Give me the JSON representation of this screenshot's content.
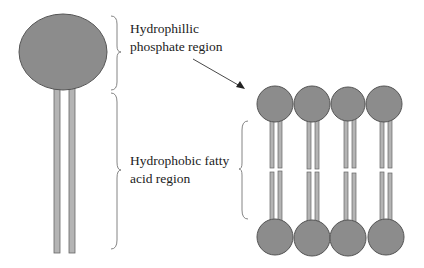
{
  "diagram": {
    "labels": {
      "head_region": {
        "line1": "Hydrophillic",
        "line2": "phosphate region"
      },
      "tail_region": {
        "line1": "Hydrophobic fatty",
        "line2": "acid region"
      }
    },
    "colors": {
      "head_fill": "#8c8c8c",
      "head_stroke": "#555555",
      "tail_fill": "#b4b4b4",
      "tail_stroke": "#666666",
      "brace_stroke": "#777777",
      "arrow": "#333333",
      "text": "#222222"
    },
    "bilayer": {
      "molecule_count_per_leaflet": 4
    }
  }
}
